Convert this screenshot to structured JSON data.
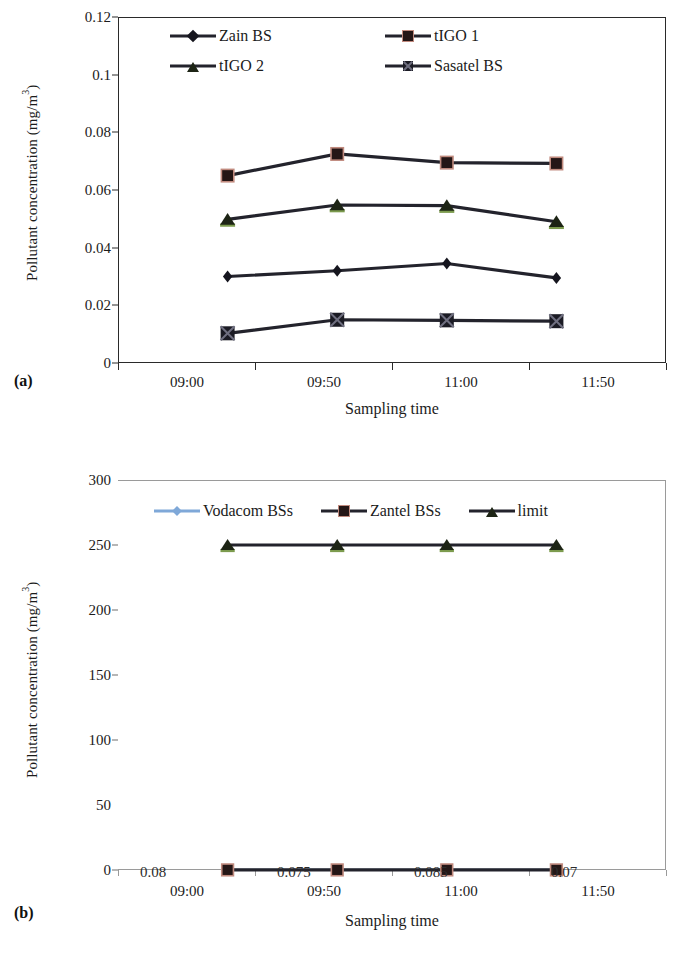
{
  "figure": {
    "panel_a_tag": "(a)",
    "panel_b_tag": "(b)"
  },
  "chart_data": [
    {
      "panel": "(a)",
      "type": "line",
      "title": "",
      "xlabel": "Sampling time",
      "ylabel": "Pollutant concentration (mg/m3)",
      "ylabel_html": "Pollutant concentration (mg/m",
      "ylabel_sup": "3",
      "ylabel_tail": ")",
      "categories": [
        "09:00",
        "09:50",
        "11:00",
        "11:50"
      ],
      "ylim": [
        0,
        0.12
      ],
      "yticks": [
        "0",
        "0.02",
        "0.04",
        "0.06",
        "0.08",
        "0.1",
        "0.12"
      ],
      "ytick_values": [
        0,
        0.02,
        0.04,
        0.06,
        0.08,
        0.1,
        0.12
      ],
      "grid": false,
      "legend_position": "top-inside",
      "series": [
        {
          "name": "Zain BS",
          "marker": "diamond",
          "color": "#15151e",
          "values": [
            0.03,
            0.032,
            0.0345,
            0.0295
          ]
        },
        {
          "name": "tIGO 1",
          "marker": "square",
          "color": "#241616",
          "values": [
            0.065,
            0.0725,
            0.0695,
            0.0692
          ]
        },
        {
          "name": "tIGO 2",
          "marker": "triangle",
          "color": "#1d2415",
          "values": [
            0.0498,
            0.0548,
            0.0546,
            0.049
          ]
        },
        {
          "name": "Sasatel BS",
          "marker": "xsquare",
          "color": "#1b1b24",
          "values": [
            0.0103,
            0.015,
            0.0148,
            0.0145
          ]
        }
      ]
    },
    {
      "panel": "(b)",
      "type": "line",
      "title": "",
      "xlabel": "Sampling time",
      "ylabel": "Pollutant concentration (mg/m3)",
      "ylabel_html": "Pollutant concentration (mg/m",
      "ylabel_sup": "3",
      "ylabel_tail": ")",
      "categories": [
        "09:00",
        "09:50",
        "11:00",
        "11:50"
      ],
      "ylim": [
        0,
        300
      ],
      "yticks": [
        "0",
        "50",
        "100",
        "150",
        "200",
        "250",
        "300"
      ],
      "ytick_values": [
        0,
        50,
        100,
        150,
        200,
        250,
        300
      ],
      "grid": false,
      "legend_position": "top-inside",
      "series": [
        {
          "name": "Vodacom BSs",
          "marker": "diamond",
          "color": "#7fa8d8",
          "values": [
            0.08,
            0.075,
            0.085,
            0.07
          ]
        },
        {
          "name": "Zantel BSs",
          "marker": "square",
          "color": "#241616",
          "values": [
            0.08,
            0.075,
            0.085,
            0.07
          ]
        },
        {
          "name": "limit",
          "marker": "triangle",
          "color": "#1d2415",
          "values": [
            250,
            250,
            250,
            250
          ]
        }
      ],
      "data_labels": [
        "0.08",
        "0.075",
        "0.085",
        "0.07"
      ]
    }
  ]
}
